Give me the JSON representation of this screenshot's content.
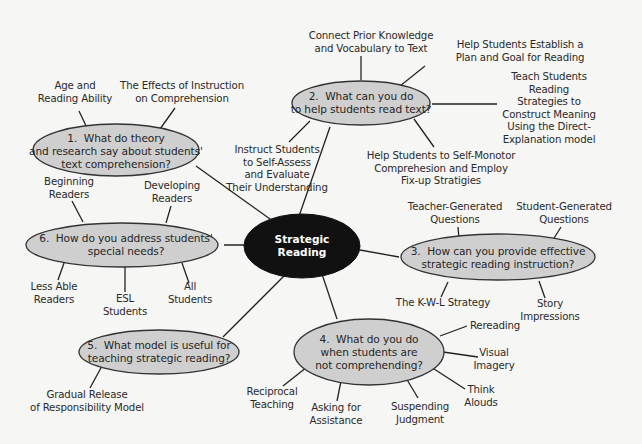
{
  "diagram": {
    "type": "concept-map",
    "center": {
      "label": "Strategic\nReading",
      "fill": "#111111",
      "text_color": "#ffffff"
    },
    "colors": {
      "background": "#f6f6f4",
      "node_fill": "#cfcfcf",
      "node_stroke": "#333333",
      "line": "#222222",
      "text": "#2a2a2a"
    },
    "questions": [
      {
        "id": "q1",
        "label": "1.  What do theory\nand research say about students'\ntext comprehension?",
        "children": [
          "Age and\nReading Ability",
          "The Effects of Instruction\non Comprehension"
        ]
      },
      {
        "id": "q2",
        "label": "2.  What can you do\nto help students read text?",
        "children": [
          "Connect Prior Knowledge\nand Vocabulary to Text",
          "Help Students Establish a\nPlan and Goal for Reading",
          "Teach Students\nReading\nStrategies to\nConstruct Meaning\nUsing the Direct-\nExplanation model",
          "Help Students to Self-Monotor\nComprehesion and Employ\nFix-up Stratigies",
          "Instruct Students\nto Self-Assess\nand Evaluate\nTheir Understanding"
        ]
      },
      {
        "id": "q3",
        "label": "3.  How can you provide effective\nstrategic reading instruction?",
        "children": [
          "Teacher-Generated\nQuestions",
          "Student-Generated\nQuestions",
          "The K-W-L Strategy",
          "Story\nImpressions"
        ]
      },
      {
        "id": "q4",
        "label": "4.  What do you do\nwhen students are\nnot comprehending?",
        "children": [
          "Rereading",
          "Visual\nImagery",
          "Think\nAlouds",
          "Suspending\nJudgment",
          "Asking for\nAssistance",
          "Reciprocal\nTeaching"
        ]
      },
      {
        "id": "q5",
        "label": "5.  What model is useful for\nteaching strategic reading?",
        "children": [
          "Gradual Release\nof Responsibility Model"
        ]
      },
      {
        "id": "q6",
        "label": "6.  How do you address students'\nspecial needs?",
        "children": [
          "Beginning\nReaders",
          "Developing\nReaders",
          "Less Able\nReaders",
          "ESL\nStudents",
          "All\nStudents"
        ]
      }
    ]
  }
}
